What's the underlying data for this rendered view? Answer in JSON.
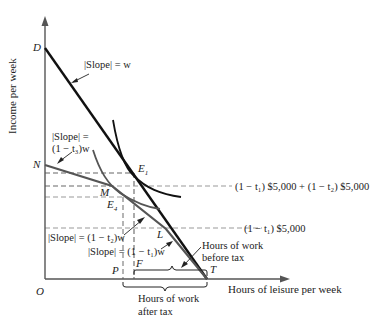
{
  "axes": {
    "y_label": "Income per week",
    "x_label": "Hours of leisure per week",
    "origin": "O"
  },
  "points": {
    "D": "D",
    "N": "N",
    "E1": "E",
    "E1_sub": "1",
    "E4": "E",
    "E4_sub": "4",
    "M": "M",
    "L": "L",
    "P": "P",
    "F": "F",
    "T": "T"
  },
  "annotations": {
    "slope_w": "|Slope| = w",
    "slope_t3_line1": "|Slope| =",
    "slope_t3_line2": "(1 − t₃)w",
    "slope_t2": "|Slope| = (1 − t₂)w",
    "slope_t1": "|Slope| = (1 − t₁)w",
    "income_level_high": "(1 − t₁) $5,000 + (1 − t₂) $5,000",
    "income_level_low": "(1 − t₁) $5,000",
    "hours_before_tax_line1": "Hours of work",
    "hours_before_tax_line2": "before tax",
    "hours_after_tax_line1": "Hours of work",
    "hours_after_tax_line2": "after tax"
  },
  "colors": {
    "budget_pre_tax": "#111111",
    "budget_post_tax": "#555555",
    "indifference": "#222222",
    "dashed": "#aaaaaa",
    "axis": "#555555"
  }
}
